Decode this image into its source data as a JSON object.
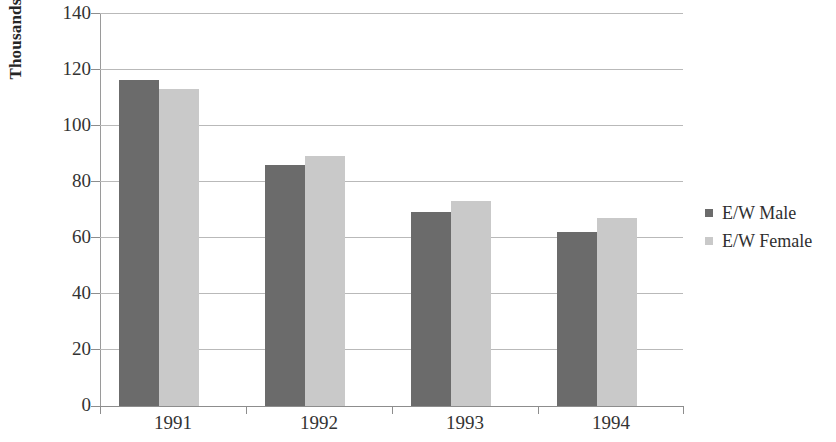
{
  "chart_data": {
    "type": "bar",
    "title": "",
    "subtitle": "",
    "xlabel": "",
    "ylabel": "Thousands",
    "categories": [
      "1991",
      "1992",
      "1993",
      "1994"
    ],
    "series": [
      {
        "name": "E/W Male",
        "color": "#6b6b6b",
        "values": [
          116,
          86,
          69,
          62
        ]
      },
      {
        "name": "E/W Female",
        "color": "#c9c9c9",
        "values": [
          113,
          89,
          73,
          67
        ]
      }
    ],
    "ylim": [
      0,
      140
    ],
    "yticks": [
      0,
      20,
      40,
      60,
      80,
      100,
      120,
      140
    ],
    "ytick_labels": [
      "0",
      "20",
      "40",
      "60",
      "80",
      "100",
      "120",
      "140"
    ],
    "grid": "horizontal",
    "legend_position": "right",
    "annotations": []
  },
  "legend": {
    "items": [
      {
        "label": "E/W Male",
        "color": "#6b6b6b",
        "marker": "square-marker-icon"
      },
      {
        "label": "E/W Female",
        "color": "#c9c9c9",
        "marker": "square-marker-icon"
      }
    ]
  },
  "axes": {
    "y_title": "Thousands",
    "y_tick_labels": [
      "140",
      "120",
      "100",
      "80",
      "60",
      "40",
      "20",
      "0"
    ],
    "x_tick_labels": [
      "1991",
      "1992",
      "1993",
      "1994"
    ]
  },
  "colors": {
    "series_male": "#6b6b6b",
    "series_female": "#c9c9c9",
    "gridline": "#b9b9b9",
    "axis": "#8d8d8d",
    "text": "#333333",
    "background": "#ffffff"
  }
}
